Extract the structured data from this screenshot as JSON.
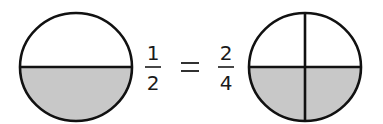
{
  "diagram": {
    "type": "equivalent-fractions",
    "colors": {
      "shaded": "#c8c8c8",
      "unshaded": "#ffffff",
      "stroke": "#111111",
      "text": "#1a1a1a"
    },
    "left_circle": {
      "parts": 2,
      "shaded_parts": 1,
      "division": "horizontal",
      "shaded_region": "bottom half"
    },
    "left_fraction": {
      "numerator": "1",
      "denominator": "2"
    },
    "equals_sign": "=",
    "right_fraction": {
      "numerator": "2",
      "denominator": "4"
    },
    "right_circle": {
      "parts": 4,
      "shaded_parts": 2,
      "division": "quarters (horizontal + vertical)",
      "shaded_region": "bottom two quarters"
    }
  }
}
